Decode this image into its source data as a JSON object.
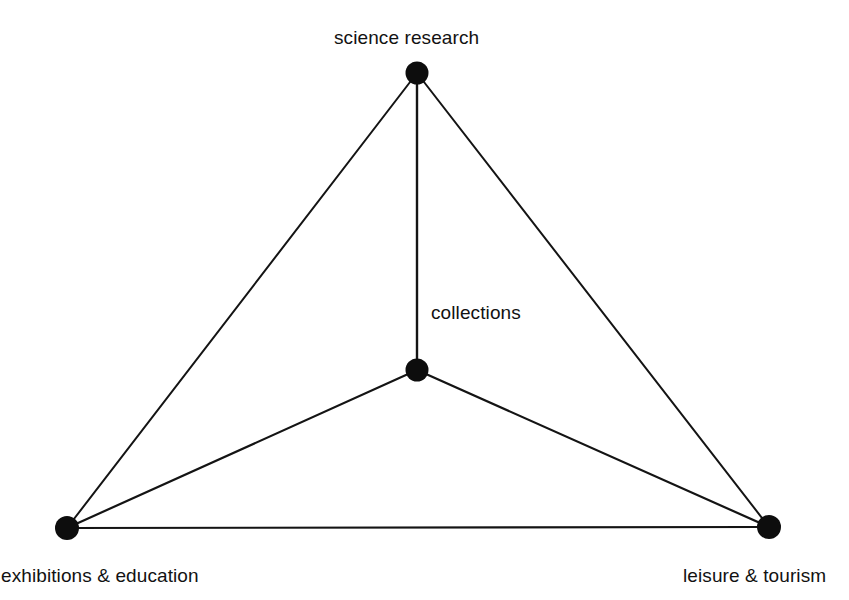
{
  "diagram": {
    "type": "node-link-diagram",
    "background_color": "#ffffff",
    "line_color": "#141414",
    "node_color": "#0d0d0d",
    "nodes": [
      {
        "id": "science_research",
        "label": "science research",
        "x": 417,
        "y": 73,
        "radius": 11,
        "label_position": "above"
      },
      {
        "id": "collections",
        "label": "collections",
        "x": 417,
        "y": 370,
        "radius": 11,
        "label_position": "above-right"
      },
      {
        "id": "exhibitions_education",
        "label": "exhibitions & education",
        "x": 67,
        "y": 528,
        "radius": 12,
        "label_position": "below"
      },
      {
        "id": "leisure_tourism",
        "label": "leisure & tourism",
        "x": 769,
        "y": 527,
        "radius": 12,
        "label_position": "below"
      }
    ],
    "edges": [
      {
        "from": "science_research",
        "to": "exhibitions_education"
      },
      {
        "from": "science_research",
        "to": "leisure_tourism"
      },
      {
        "from": "exhibitions_education",
        "to": "leisure_tourism"
      },
      {
        "from": "science_research",
        "to": "collections"
      },
      {
        "from": "collections",
        "to": "exhibitions_education"
      },
      {
        "from": "collections",
        "to": "leisure_tourism"
      }
    ]
  }
}
